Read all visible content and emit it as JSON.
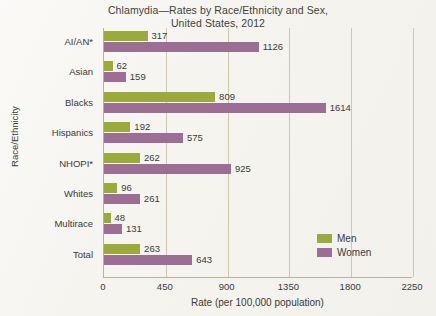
{
  "chart_data": {
    "type": "bar",
    "orientation": "horizontal",
    "title": "Chlamydia—Rates by Race/Ethnicity and Sex,",
    "subtitle": "United States, 2012",
    "title_lines": [
      "Chlamydia—Rates by Race/Ethnicity and Sex,",
      "United States, 2012"
    ],
    "xlabel": "Rate (per 100,000 population)",
    "ylabel": "Race/Ethnicity",
    "categories": [
      "AI/AN*",
      "Asian",
      "Blacks",
      "Hispanics",
      "NHOPI*",
      "Whites",
      "Multirace",
      "Total"
    ],
    "series": [
      {
        "name": "Men",
        "color": "#9aab3a",
        "values": [
          317,
          62,
          809,
          192,
          262,
          96,
          48,
          263
        ]
      },
      {
        "name": "Women",
        "color": "#9d6e94",
        "values": [
          1126,
          159,
          1614,
          575,
          925,
          261,
          131,
          643
        ]
      }
    ],
    "xticks": [
      0,
      450,
      900,
      1350,
      1800,
      2250
    ],
    "xtick_labels": [
      "0",
      "450",
      "900",
      "1350",
      "1800",
      "2250"
    ],
    "xlim": [
      0,
      2250
    ],
    "grid": "vertical",
    "legend_position": "bottom-right",
    "legend": [
      {
        "label": "Men",
        "color": "#9aab3a"
      },
      {
        "label": "Women",
        "color": "#9d6e94"
      }
    ]
  }
}
